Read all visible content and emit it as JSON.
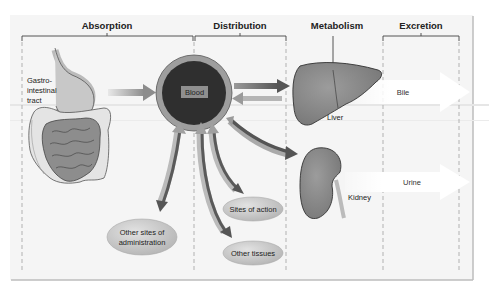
{
  "diagram": {
    "headers": {
      "absorption": "Absorption",
      "distribution": "Distribution",
      "metabolism": "Metabolism",
      "excretion": "Excretion"
    },
    "nodes": {
      "gi_tract": {
        "line1": "Gastro-",
        "line2": "intestinal",
        "line3": "tract"
      },
      "blood": "Blood",
      "liver": "Liver",
      "kidney": "Kidney",
      "other_sites": {
        "line1": "Other sites of",
        "line2": "administration"
      },
      "sites_of_action": "Sites of action",
      "other_tissues": "Other tissues",
      "bile": "Bile",
      "urine": "Urine"
    },
    "colors": {
      "panel_bg": "#f4f4f4",
      "blood_core": "#2e2e2e",
      "blood_ring": "#9a9a9a",
      "organ_fill": "#8a8a8a",
      "oval_fill": "#c9c9c9",
      "arrow_dark": "#5a5a5a",
      "arrow_light": "#b8b8b8"
    }
  }
}
